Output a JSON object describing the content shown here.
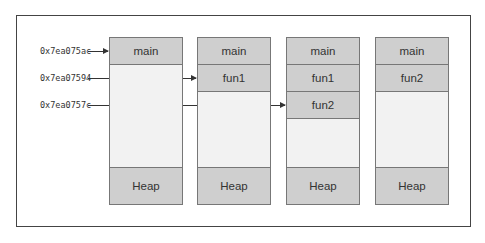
{
  "diagram": {
    "addresses": [
      {
        "label": "0x7ea075ac",
        "target": "main"
      },
      {
        "label": "0x7ea07594",
        "target": "fun1"
      },
      {
        "label": "0x7ea0757c",
        "target": "fun2"
      }
    ],
    "stacks": [
      {
        "frames": [
          "main"
        ],
        "heap": "Heap"
      },
      {
        "frames": [
          "main",
          "fun1"
        ],
        "heap": "Heap"
      },
      {
        "frames": [
          "main",
          "fun1",
          "fun2"
        ],
        "heap": "Heap"
      },
      {
        "frames": [
          "main",
          "fun2"
        ],
        "heap": "Heap"
      }
    ]
  }
}
